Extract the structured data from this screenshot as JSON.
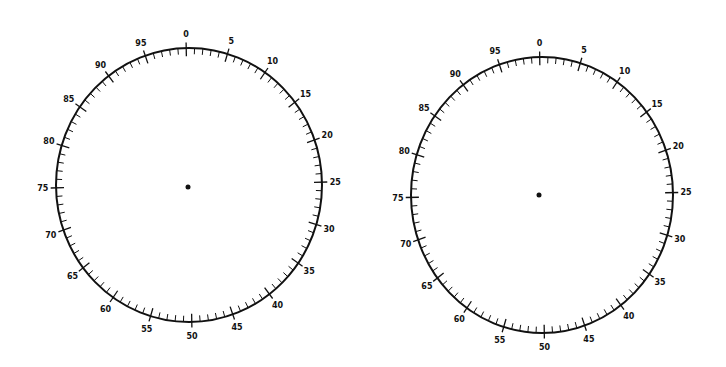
{
  "dials": [
    {
      "id": "left-dial",
      "cx": 189,
      "cy": 185,
      "rx": 133,
      "ry": 137,
      "rotation": -1.2,
      "dot": {
        "x": 188,
        "y": 187
      },
      "divisions": 100,
      "labels": [
        "0",
        "5",
        "10",
        "15",
        "20",
        "25",
        "30",
        "35",
        "40",
        "45",
        "50",
        "55",
        "60",
        "65",
        "70",
        "75",
        "80",
        "85",
        "90",
        "95"
      ]
    },
    {
      "id": "right-dial",
      "cx": 542,
      "cy": 195,
      "rx": 131,
      "ry": 138,
      "rotation": -1.0,
      "dot": {
        "x": 539,
        "y": 195
      },
      "divisions": 100,
      "labels": [
        "0",
        "5",
        "10",
        "15",
        "20",
        "25",
        "30",
        "35",
        "40",
        "45",
        "50",
        "55",
        "60",
        "65",
        "70",
        "75",
        "80",
        "85",
        "90",
        "95"
      ]
    }
  ],
  "colors": {
    "ink": "#111111",
    "background": "#ffffff"
  }
}
